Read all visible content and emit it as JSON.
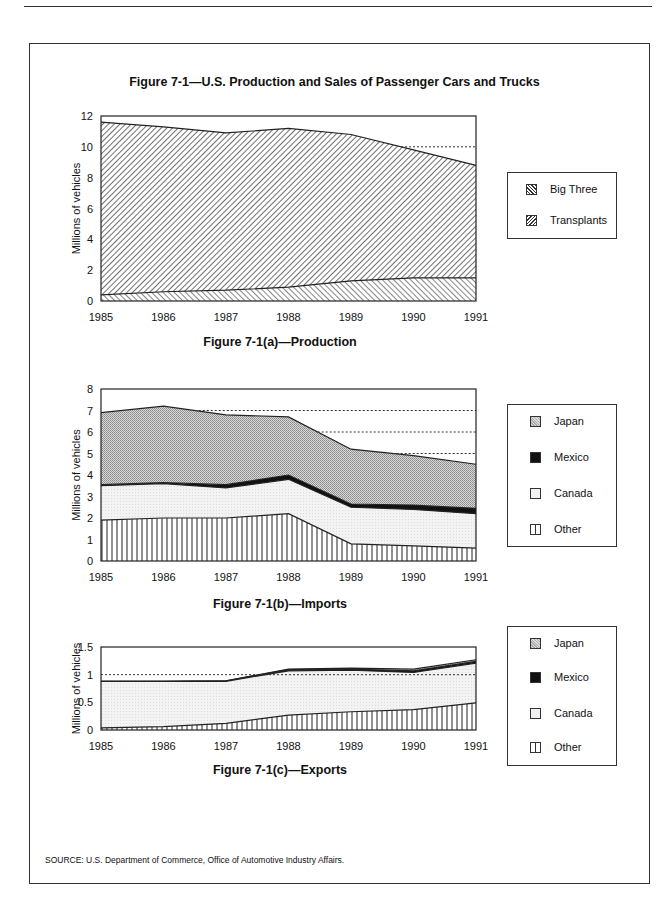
{
  "figure": {
    "title": "Figure 7-1—U.S. Production and Sales of Passenger Cars and Trucks",
    "source": "SOURCE: U.S. Department of Commerce, Office of Automotive Industry Affairs."
  },
  "chart_data": [
    {
      "id": "production",
      "type": "area",
      "stacked": true,
      "title": "Figure 7-1(a)—Production",
      "xlabel": "",
      "ylabel": "Millions of vehicles",
      "x": [
        "1985",
        "1986",
        "1987",
        "1988",
        "1989",
        "1990",
        "1991"
      ],
      "yticks": [
        0,
        2,
        4,
        6,
        8,
        10,
        12
      ],
      "ylim": [
        0,
        12
      ],
      "grid": false,
      "legend_position": "right",
      "reference_lines": [
        10
      ],
      "series": [
        {
          "name": "Transplants",
          "values": [
            0.4,
            0.6,
            0.7,
            0.9,
            1.3,
            1.5,
            1.5
          ]
        },
        {
          "name": "Big Three",
          "values": [
            11.2,
            10.7,
            10.2,
            10.3,
            9.5,
            8.3,
            7.3
          ]
        }
      ],
      "legend": [
        "Big Three",
        "Transplants"
      ]
    },
    {
      "id": "imports",
      "type": "area",
      "stacked": true,
      "title": "Figure 7-1(b)—Imports",
      "xlabel": "",
      "ylabel": "Millions of vehicles",
      "x": [
        "1985",
        "1986",
        "1987",
        "1988",
        "1989",
        "1990",
        "1991"
      ],
      "yticks": [
        0,
        1,
        2,
        3,
        4,
        5,
        6,
        7,
        8
      ],
      "ylim": [
        0,
        8
      ],
      "grid": false,
      "legend_position": "right",
      "reference_lines": [
        7,
        6,
        5
      ],
      "series": [
        {
          "name": "Other",
          "values": [
            1.9,
            2.0,
            2.0,
            2.2,
            0.8,
            0.7,
            0.6
          ]
        },
        {
          "name": "Canada",
          "values": [
            1.6,
            1.6,
            1.4,
            1.6,
            1.7,
            1.7,
            1.6
          ]
        },
        {
          "name": "Mexico",
          "values": [
            0.05,
            0.05,
            0.15,
            0.2,
            0.15,
            0.2,
            0.25
          ]
        },
        {
          "name": "Japan",
          "values": [
            3.35,
            3.55,
            3.25,
            2.7,
            2.55,
            2.3,
            2.05
          ]
        }
      ],
      "legend": [
        "Japan",
        "Mexico",
        "Canada",
        "Other"
      ]
    },
    {
      "id": "exports",
      "type": "area",
      "stacked": true,
      "title": "Figure 7-1(c)—Exports",
      "xlabel": "",
      "ylabel": "Millions of vehicles",
      "x": [
        "1985",
        "1986",
        "1987",
        "1988",
        "1989",
        "1990",
        "1991"
      ],
      "yticks": [
        0,
        0.5,
        1,
        1.5
      ],
      "ylim": [
        0,
        1.5
      ],
      "grid": false,
      "legend_position": "right",
      "reference_lines": [
        1
      ],
      "series": [
        {
          "name": "Other",
          "values": [
            0.04,
            0.06,
            0.12,
            0.27,
            0.33,
            0.37,
            0.49
          ]
        },
        {
          "name": "Canada",
          "values": [
            0.84,
            0.82,
            0.76,
            0.8,
            0.75,
            0.67,
            0.72
          ]
        },
        {
          "name": "Mexico",
          "values": [
            0.0,
            0.0,
            0.01,
            0.02,
            0.02,
            0.03,
            0.03
          ]
        },
        {
          "name": "Japan",
          "values": [
            0.0,
            0.0,
            0.0,
            0.01,
            0.02,
            0.03,
            0.03
          ]
        }
      ],
      "legend": [
        "Japan",
        "Mexico",
        "Canada",
        "Other"
      ]
    }
  ]
}
